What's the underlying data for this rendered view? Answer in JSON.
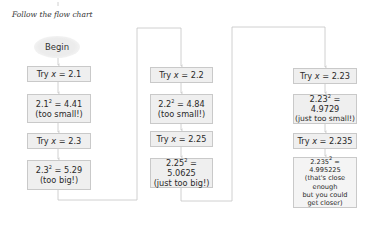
{
  "title": "Follow the flow chart",
  "begin": "Begin",
  "columns": [
    {
      "steps": [
        {
          "type": "try",
          "prefix": "Try ",
          "var": "x",
          "rest": " = 2.1"
        },
        {
          "type": "square",
          "base": "2.1",
          "exp": "2",
          "result": " = 4.41",
          "note": "(too small!)"
        },
        {
          "type": "try",
          "prefix": "Try ",
          "var": "x",
          "rest": " = 2.3"
        },
        {
          "type": "square",
          "base": "2.3",
          "exp": "2",
          "result": " = 5.29",
          "note": "(too big!)"
        }
      ]
    },
    {
      "steps": [
        {
          "type": "try",
          "prefix": "Try ",
          "var": "x",
          "rest": " = 2.2"
        },
        {
          "type": "square",
          "base": "2.2",
          "exp": "2",
          "result": " = 4.84",
          "note": "(too small!)"
        },
        {
          "type": "try",
          "prefix": "Try ",
          "var": "x",
          "rest": " = 2.25"
        },
        {
          "type": "square",
          "base": "2.25",
          "exp": "2",
          "result": " = 5.0625",
          "note": "(just too big!)"
        }
      ]
    },
    {
      "steps": [
        {
          "type": "try",
          "prefix": "Try ",
          "var": "x",
          "rest": " = 2.23"
        },
        {
          "type": "square",
          "base": "2.23",
          "exp": "2",
          "result": " = 4.9729",
          "note": "(just too small!)"
        },
        {
          "type": "try",
          "prefix": "Try ",
          "var": "x",
          "rest": " = 2.235"
        },
        {
          "type": "square",
          "base": "2.235",
          "exp": "2",
          "result": " = 4.995225",
          "note_lines": [
            "(that's close enough",
            "but you could",
            "get closer)"
          ]
        }
      ]
    }
  ],
  "colors": {
    "box_fill": "#efefef",
    "box_border": "#c9c9c9",
    "line": "#c4c4c4",
    "text": "#2a2a2a"
  }
}
